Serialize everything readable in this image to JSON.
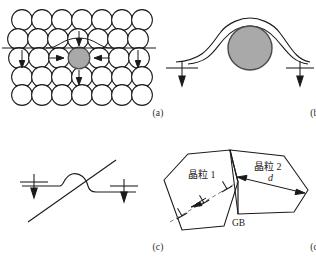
{
  "figure": {
    "panels": [
      {
        "id": "a",
        "caption": "(a)",
        "description": "Close-packed atomic lattice with solute atom and dislocation line",
        "solute_atom_color": "#a9a9a9",
        "atom_outline_color": "#1a1a1a",
        "atom_fill_color": "#ffffff",
        "arrow_count": 6,
        "rows": 5,
        "atoms_per_row": 7
      },
      {
        "id": "b",
        "caption": "(b)",
        "description": "Dislocation line bowing around obstacle particle",
        "particle_color": "#a9a9a9",
        "arrow_count": 2
      },
      {
        "id": "c",
        "caption": "(c)",
        "description": "Dislocation line cutting through inclined slip plane with step",
        "arrow_count": 2
      },
      {
        "id": "d",
        "caption": "(d)",
        "description": "Two adjacent grains separated by a grain boundary with dislocation pile-up",
        "grain1_label": "晶粒 1",
        "grain2_label": "晶粒 2",
        "boundary_label": "GB",
        "dimension_label": "d",
        "dislocation_symbol": "⊥"
      }
    ]
  },
  "colors": {
    "line": "#1a1a1a",
    "gray_fill": "#a9a9a9",
    "gray_stroke": "#555555",
    "background": "#ffffff",
    "text": "#1a1a1a"
  }
}
